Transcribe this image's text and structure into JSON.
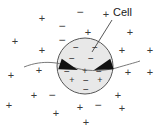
{
  "figure": {
    "background_color": "#ffffff",
    "width": 159,
    "height": 131
  },
  "label": {
    "text": "Cell",
    "x": 113,
    "y": 6,
    "color": "#1a1a1a",
    "leader_line": {
      "from_x": 112,
      "from_y": 20,
      "to_x": 92,
      "to_y": 52,
      "color": "#444444"
    }
  },
  "cell": {
    "name": "cell-membrane-circle",
    "cx": 85,
    "cy": 66,
    "r": 28,
    "fill": "#e8e8e8",
    "stroke": "#555555",
    "stroke_width": 1
  },
  "field_line": {
    "name": "field-line",
    "color": "#6a6a6a",
    "path": "M 24,67 C 44,59 60,63 72,67 C 84,71 100,72 116,68 C 126,65 134,63 140,61"
  },
  "arrows": [
    {
      "name": "arrow-left-inward",
      "x1": 60,
      "y1": 64,
      "x2": 78,
      "y2": 70,
      "color": "#111111"
    },
    {
      "name": "arrow-right-inward",
      "x1": 112,
      "y1": 64,
      "x2": 94,
      "y2": 70,
      "color": "#111111"
    }
  ],
  "outside_charges": [
    {
      "sign": "+",
      "x": 42,
      "y": 18
    },
    {
      "sign": "−",
      "x": 80,
      "y": 12
    },
    {
      "sign": "+",
      "x": 106,
      "y": 14
    },
    {
      "sign": "−",
      "x": 62,
      "y": 26
    },
    {
      "sign": "+",
      "x": 88,
      "y": 32
    },
    {
      "sign": "+",
      "x": 130,
      "y": 32
    },
    {
      "sign": "+",
      "x": 15,
      "y": 41
    },
    {
      "sign": "−",
      "x": 62,
      "y": 40
    },
    {
      "sign": "+",
      "x": 42,
      "y": 50
    },
    {
      "sign": "+",
      "x": 122,
      "y": 50
    },
    {
      "sign": "+",
      "x": 150,
      "y": 50
    },
    {
      "sign": "+",
      "x": 11,
      "y": 75
    },
    {
      "sign": "+",
      "x": 39,
      "y": 70
    },
    {
      "sign": "+",
      "x": 128,
      "y": 72
    },
    {
      "sign": "+",
      "x": 150,
      "y": 72
    },
    {
      "sign": "+",
      "x": 34,
      "y": 95
    },
    {
      "sign": "−",
      "x": 52,
      "y": 95
    },
    {
      "sign": "+",
      "x": 118,
      "y": 95
    },
    {
      "sign": "+",
      "x": 9,
      "y": 105
    },
    {
      "sign": "−",
      "x": 98,
      "y": 105
    },
    {
      "sign": "+",
      "x": 122,
      "y": 108
    },
    {
      "sign": "+",
      "x": 80,
      "y": 107
    },
    {
      "sign": "+",
      "x": 56,
      "y": 113
    },
    {
      "sign": "+",
      "x": 86,
      "y": 122
    }
  ],
  "inside_charges": [
    {
      "sign": "−",
      "x": 76,
      "y": 47
    },
    {
      "sign": "−",
      "x": 95,
      "y": 47
    },
    {
      "sign": "−",
      "x": 72,
      "y": 58
    },
    {
      "sign": "−",
      "x": 91,
      "y": 58
    },
    {
      "sign": "−",
      "x": 67,
      "y": 71
    },
    {
      "sign": "+",
      "x": 85,
      "y": 71
    },
    {
      "sign": "−",
      "x": 99,
      "y": 71
    },
    {
      "sign": "+",
      "x": 72,
      "y": 80
    },
    {
      "sign": "−",
      "x": 86,
      "y": 80
    },
    {
      "sign": "+",
      "x": 100,
      "y": 80
    },
    {
      "sign": "−",
      "x": 86,
      "y": 89
    }
  ]
}
